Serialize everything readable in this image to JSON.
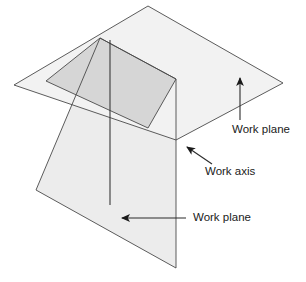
{
  "figure": {
    "background_color": "#ffffff",
    "width": 306,
    "height": 282
  },
  "colors": {
    "outline": "#4a4a4a",
    "horizontal_plane_fill": "#f2f2f2",
    "vertical_plane_fill": "#ececec",
    "intersection_band_fill": "#d6d6d6",
    "axis_line": "#3a3a3a",
    "leader_line": "#2b2b2b",
    "text": "#1a1a1a"
  },
  "shapes": {
    "horizontal_plane": {
      "name": "horizontal-work-plane",
      "points": "148,6 283,83 176,140 14,85",
      "fill": "#f2f2f2"
    },
    "vertical_plane": {
      "name": "vertical-work-plane",
      "points": "100,38 176,79 176,268 36,190",
      "fill": "#ececec"
    },
    "intersection_band": {
      "name": "plane-intersection-band",
      "points": "100,38 176,79 148,128 46,81",
      "fill": "#d6d6d6"
    },
    "work_axis_line": {
      "name": "work-axis-line",
      "x1": 110,
      "y1": 40,
      "x2": 110,
      "y2": 205
    },
    "work_axis_stub": {
      "name": "work-axis-upper-stub",
      "x1": 110,
      "y1": 38,
      "x2": 110,
      "y2": 62
    },
    "intersection_point": {
      "x": 176,
      "y": 140
    }
  },
  "labels": [
    {
      "id": "label-work-plane-top",
      "text": "Work plane",
      "text_x": 232,
      "text_y": 130,
      "arrow": {
        "name": "arrow-up-to-horizontal-plane",
        "x1": 240,
        "y1": 120,
        "x2": 240,
        "y2": 78,
        "direction": "up"
      }
    },
    {
      "id": "label-work-axis",
      "text": "Work axis",
      "text_x": 205,
      "text_y": 172,
      "arrow": {
        "name": "arrow-upleft-to-work-axis",
        "x1": 212,
        "y1": 164,
        "x2": 187,
        "y2": 147,
        "direction": "up-left"
      }
    },
    {
      "id": "label-work-plane-bottom",
      "text": "Work plane",
      "text_x": 193,
      "text_y": 218,
      "arrow": {
        "name": "arrow-left-to-vertical-plane",
        "x1": 186,
        "y1": 218,
        "x2": 122,
        "y2": 218,
        "direction": "left"
      }
    }
  ]
}
